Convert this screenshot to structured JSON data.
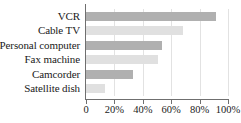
{
  "chart_data": {
    "type": "bar",
    "orientation": "horizontal",
    "title": "",
    "subtitle": "",
    "xlabel": "",
    "ylabel": "",
    "xlim": [
      0,
      100
    ],
    "grid": true,
    "legend": false,
    "legend_position": "none",
    "categories": [
      "VCR",
      "Cable TV",
      "Personal computer",
      "Fax machine",
      "Camcorder",
      "Satellite dish"
    ],
    "values": [
      91.5,
      68,
      53.5,
      51,
      33,
      13.5
    ],
    "xticks": [
      0,
      20,
      40,
      60,
      80,
      100
    ],
    "xtick_labels": [
      "0",
      "20%",
      "40%",
      "60%",
      "80%",
      "100%"
    ],
    "bar_colors": [
      "#b0b0b0",
      "#e0e0e0",
      "#b0b0b0",
      "#e0e0e0",
      "#b0b0b0",
      "#e0e0e0"
    ],
    "axis_color": "#6f6f6f",
    "gridline_color": "#e2e2e2",
    "text_color": "#1a1a1a",
    "background": "#ffffff"
  }
}
